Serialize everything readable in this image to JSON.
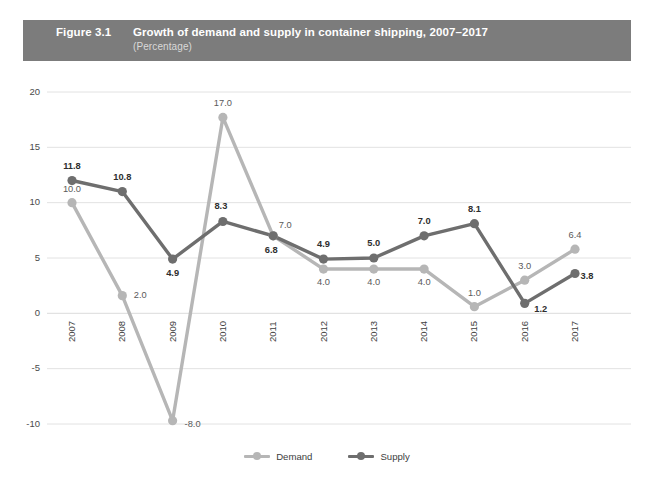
{
  "header": {
    "figure_number": "Figure 3.1",
    "title": "Growth of demand and supply in container shipping, 2007–2017",
    "subtitle": "(Percentage)",
    "band_color": "#7c7c7c"
  },
  "legend": {
    "position": "bottom-center",
    "items": [
      {
        "label": "Demand",
        "color": "#b6b6b6"
      },
      {
        "label": "Supply",
        "color": "#6e6e6e"
      }
    ]
  },
  "colors": {
    "demand": "#b6b6b6",
    "supply": "#6e6e6e",
    "gridline": "#e2e2e2",
    "tick_text": "#4a4a4a"
  },
  "chart_data": {
    "type": "line",
    "title": "Growth of demand and supply in container shipping, 2007–2017",
    "subtitle": "(Percentage)",
    "xlabel": "",
    "ylabel": "",
    "ylim": [
      -10,
      20
    ],
    "yticks": [
      20,
      15,
      10,
      5,
      0,
      -5,
      -10
    ],
    "ytick_labels": [
      "20",
      "15",
      "10",
      "5",
      "0",
      "-5",
      "-10"
    ],
    "grid": true,
    "legend_position": "bottom",
    "categories": [
      "2007",
      "2008",
      "2009",
      "2010",
      "2011",
      "2012",
      "2013",
      "2014",
      "2015",
      "2016",
      "2017"
    ],
    "series": [
      {
        "name": "Demand",
        "color": "#b6b6b6",
        "values": [
          10.0,
          2.0,
          -8.0,
          17.0,
          7.0,
          4.0,
          4.0,
          4.0,
          1.0,
          3.0,
          6.4
        ],
        "labels": [
          "10.0",
          "2.0",
          "-8.0",
          "17.0",
          "7.0",
          "4.0",
          "4.0",
          "4.0",
          "1.0",
          "3.0",
          "6.4"
        ],
        "plotted_y": [
          10.0,
          1.6,
          -9.7,
          17.7,
          7.0,
          4.0,
          4.0,
          4.0,
          0.6,
          3.0,
          5.8
        ]
      },
      {
        "name": "Supply",
        "color": "#6e6e6e",
        "values": [
          11.8,
          10.8,
          4.9,
          8.3,
          6.8,
          4.9,
          5.0,
          7.0,
          8.1,
          1.2,
          3.8
        ],
        "labels": [
          "11.8",
          "10.8",
          "4.9",
          "8.3",
          "6.8",
          "4.9",
          "5.0",
          "7.0",
          "8.1",
          "1.2",
          "3.8"
        ],
        "plotted_y": [
          12.0,
          11.0,
          4.9,
          8.3,
          7.0,
          4.9,
          5.0,
          7.0,
          8.1,
          0.9,
          3.6
        ]
      }
    ]
  }
}
